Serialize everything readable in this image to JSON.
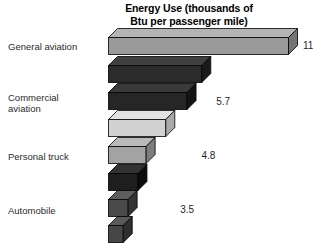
{
  "chart_data": {
    "type": "bar",
    "orientation": "horizontal",
    "style": "3d-blocks",
    "title": "Energy Use (thousands of Btu per passenger mile)",
    "title_lines": [
      "Energy Use (thousands of",
      "Btu per passenger mile)"
    ],
    "xlabel": "",
    "ylabel": "",
    "xlim": [
      0,
      11
    ],
    "grid": false,
    "legend": null,
    "unit": "thousands of Btu per passenger mile",
    "categories": [
      "General aviation",
      "Commercial aviation",
      "Personal truck",
      "Automobile",
      "Motorcycle",
      "AMTRAK railroad",
      "Intercity high-speed train",
      "Intercity bus"
    ],
    "values": [
      11,
      5.7,
      4.8,
      3.5,
      2.3,
      1.8,
      1.2,
      0.9
    ],
    "value_labels": [
      "11",
      "5.7",
      "4.8",
      "3.5",
      "2.3",
      "1.8",
      "1.2",
      "0.9"
    ],
    "bars": [
      {
        "category": "General aviation",
        "label_lines": [
          "General aviation"
        ],
        "value": 11,
        "value_label": "11",
        "face_color": "#9a9a9a",
        "top_color": "#b4b4b4",
        "side_color": "#747474"
      },
      {
        "category": "Commercial aviation",
        "label_lines": [
          "Commercial",
          "aviation"
        ],
        "value": 5.7,
        "value_label": "5.7",
        "face_color": "#2b2b2b",
        "top_color": "#3f3f3f",
        "side_color": "#1a1a1a"
      },
      {
        "category": "Personal truck",
        "label_lines": [
          "Personal truck"
        ],
        "value": 4.8,
        "value_label": "4.8",
        "face_color": "#262626",
        "top_color": "#3a3a3a",
        "side_color": "#141414"
      },
      {
        "category": "Automobile",
        "label_lines": [
          "Automobile"
        ],
        "value": 3.5,
        "value_label": "3.5",
        "face_color": "#d2d2d2",
        "top_color": "#e2e2e2",
        "side_color": "#a9a9a9"
      },
      {
        "category": "Motorcycle",
        "label_lines": [
          "Motorcycle"
        ],
        "value": 2.3,
        "value_label": "2.3",
        "face_color": "#a3a3a3",
        "top_color": "#b9b9b9",
        "side_color": "#7d7d7d"
      },
      {
        "category": "AMTRAK railroad",
        "label_lines": [
          "AMTRAK railroad"
        ],
        "value": 1.8,
        "value_label": "1.8",
        "face_color": "#1e1e1e",
        "top_color": "#323232",
        "side_color": "#0d0d0d"
      },
      {
        "category": "Intercity high-speed train",
        "label_lines": [
          "Intercity",
          "high-speed train"
        ],
        "value": 1.2,
        "value_label": "1.2",
        "face_color": "#4a4a4a",
        "top_color": "#5e5e5e",
        "side_color": "#333333"
      },
      {
        "category": "Intercity bus",
        "label_lines": [
          "Intercity bus"
        ],
        "value": 0.9,
        "value_label": "0.9",
        "face_color": "#464646",
        "top_color": "#5a5a5a",
        "side_color": "#2f2f2f"
      }
    ]
  }
}
